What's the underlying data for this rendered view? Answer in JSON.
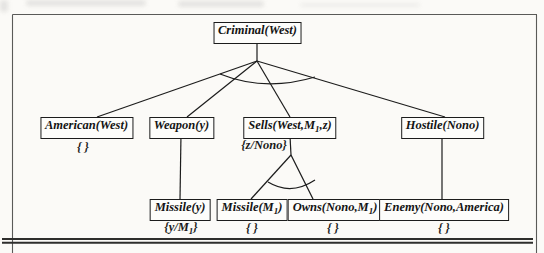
{
  "figure": {
    "background": "#fbfaf7",
    "line_color": "#1c1c1c",
    "frame_color": "#5a5a58",
    "rule_color": "#2e2e2c"
  },
  "tree": {
    "nodes": [
      {
        "id": "criminal-west",
        "pre": "Criminal(West)",
        "sub": "",
        "post": ""
      },
      {
        "id": "american-west",
        "pre": "American(West)",
        "sub": "",
        "post": ""
      },
      {
        "id": "weapon-y",
        "pre": "Weapon(y)",
        "sub": "",
        "post": ""
      },
      {
        "id": "sells-west-m1-z",
        "pre": "Sells(West,M",
        "sub": "1",
        "post": ",z)"
      },
      {
        "id": "hostile-nono",
        "pre": "Hostile(Nono)",
        "sub": "",
        "post": ""
      },
      {
        "id": "missile-y",
        "pre": "Missile(y)",
        "sub": "",
        "post": ""
      },
      {
        "id": "missile-m1",
        "pre": "Missile(M",
        "sub": "1",
        "post": ")"
      },
      {
        "id": "owns-nono-m1",
        "pre": "Owns(Nono,M",
        "sub": "1",
        "post": ")"
      },
      {
        "id": "enemy-nono-america",
        "pre": "Enemy(Nono,America)",
        "sub": "",
        "post": ""
      }
    ],
    "substitutions": [
      {
        "id": "american",
        "pre": "{ }",
        "sub": "",
        "post": ""
      },
      {
        "id": "sells",
        "pre": "{z/Nono}",
        "sub": "",
        "post": ""
      },
      {
        "id": "missile-y",
        "pre": "{y/M",
        "sub": "1",
        "post": "}"
      },
      {
        "id": "missile-m1",
        "pre": "{ }",
        "sub": "",
        "post": ""
      },
      {
        "id": "owns",
        "pre": "{ }",
        "sub": "",
        "post": ""
      },
      {
        "id": "enemy",
        "pre": "{ }",
        "sub": "",
        "post": ""
      }
    ]
  }
}
